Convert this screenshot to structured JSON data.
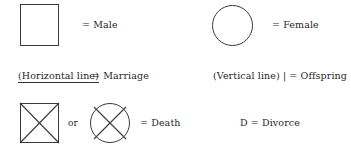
{
  "figure": {
    "type": "pedigree-symbol-legend",
    "background_color": "#ffffff",
    "stroke_color": "#3a3a3a",
    "text_color": "#1f1f1f"
  },
  "legend": {
    "male": {
      "symbol_name": "square",
      "equals": "=",
      "label": "= Male"
    },
    "female": {
      "symbol_name": "circle",
      "equals": "=",
      "label": "= Female"
    },
    "marriage": {
      "symbol_name": "horizontal-line",
      "term": "(Horizontal line)",
      "label": "=  Marriage",
      "underlined": true
    },
    "offspring": {
      "symbol_name": "vertical-line",
      "term": "(Vertical line)",
      "glyph": "|",
      "label": "(Vertical line) |  =  Offspring",
      "underlined": false
    },
    "death": {
      "symbol_name_a": "crossed-square",
      "symbol_name_b": "crossed-circle",
      "conjunction": "or",
      "label": "=  Death"
    },
    "divorce": {
      "symbol_name": "letter-d",
      "label": "D  =  Divorce"
    }
  }
}
